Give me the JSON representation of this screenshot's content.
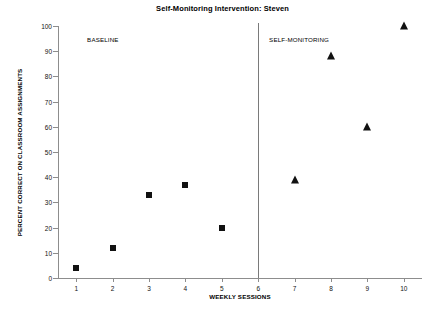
{
  "chart_data": {
    "type": "scatter",
    "title": "Self-Monitoring Intervention:  Steven",
    "xlabel": "WEEKLY SESSIONS",
    "ylabel": "PERCENT CORRECT ON CLASSROOM ASSIGNMENTS",
    "xlim": [
      0.5,
      10.5
    ],
    "ylim": [
      0,
      100
    ],
    "grid": false,
    "legend_position": "none",
    "xticks": [
      1,
      2,
      3,
      4,
      5,
      6,
      7,
      8,
      9,
      10
    ],
    "xtick_labels": [
      "1",
      "2",
      "3",
      "4",
      "5",
      "6",
      "7",
      "8",
      "9",
      "10"
    ],
    "yticks": [
      0,
      10,
      20,
      30,
      40,
      50,
      60,
      70,
      80,
      90,
      100
    ],
    "ytick_labels": [
      "0",
      "10",
      "20",
      "30",
      "40",
      "50",
      "60",
      "70",
      "80",
      "90",
      "100"
    ],
    "annotations": [
      {
        "text": "BASELINE",
        "x": 1.3,
        "y": 96
      },
      {
        "text": "SELF-MONITORING",
        "x": 6.3,
        "y": 96
      }
    ],
    "phase_line": {
      "x": 6.0
    },
    "series": [
      {
        "name": "BASELINE",
        "marker": "square",
        "color": "#111111",
        "x": [
          1,
          2,
          3,
          4,
          5
        ],
        "values": [
          4,
          12,
          33,
          37,
          20
        ]
      },
      {
        "name": "SELF-MONITORING",
        "marker": "triangle",
        "color": "#111111",
        "x": [
          7,
          8,
          9,
          10
        ],
        "values": [
          39,
          88,
          60,
          100
        ]
      }
    ]
  }
}
